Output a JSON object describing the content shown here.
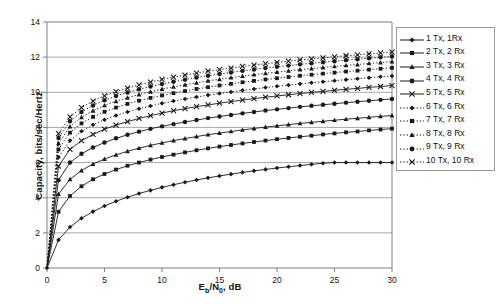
{
  "chart_data": {
    "type": "line",
    "title": "",
    "xlabel": "Eb/N0, dB",
    "xlabel_parts": {
      "pre": "E",
      "sub1": "b",
      "mid": "/N",
      "sub2": "0",
      "post": ", dB"
    },
    "ylabel": "Capacity, bits/sec/Hertz",
    "xlim": [
      0,
      30
    ],
    "ylim": [
      0,
      14
    ],
    "xticks": [
      0,
      5,
      10,
      15,
      20,
      25,
      30
    ],
    "yticks": [
      0,
      2,
      4,
      6,
      8,
      10,
      12,
      14
    ],
    "grid": "horizontal",
    "legend_position": "right-outside",
    "x": [
      0,
      1,
      2,
      3,
      4,
      5,
      6,
      7,
      8,
      9,
      10,
      11,
      12,
      13,
      14,
      15,
      16,
      17,
      18,
      19,
      20,
      21,
      22,
      23,
      24,
      25,
      26,
      27,
      28,
      29,
      30
    ],
    "series": [
      {
        "name": "1 Tx, 1Rx",
        "marker": "diamond",
        "line_style": "solid",
        "values": [
          0,
          1.6,
          2.33,
          2.83,
          3.21,
          3.53,
          3.8,
          4.03,
          4.24,
          4.42,
          4.59,
          4.74,
          4.88,
          5.01,
          5.13,
          5.24,
          5.34,
          5.44,
          5.53,
          5.61,
          5.69,
          5.76,
          5.83,
          5.9,
          5.96,
          6.0,
          6.0,
          6.0,
          6.0,
          6.0,
          6.0
        ]
      },
      {
        "name": "2 Tx, 2 Rx",
        "marker": "square",
        "line_style": "solid",
        "values": [
          0,
          3.2,
          4.1,
          4.65,
          5.05,
          5.35,
          5.6,
          5.82,
          6.0,
          6.17,
          6.32,
          6.45,
          6.58,
          6.7,
          6.81,
          6.91,
          7.0,
          7.09,
          7.17,
          7.25,
          7.33,
          7.4,
          7.47,
          7.53,
          7.6,
          7.66,
          7.72,
          7.77,
          7.83,
          7.88,
          7.93
        ]
      },
      {
        "name": "3 Tx, 3 Rx",
        "marker": "triangle",
        "line_style": "solid",
        "values": [
          0,
          4.2,
          5.05,
          5.55,
          5.92,
          6.2,
          6.44,
          6.64,
          6.82,
          6.98,
          7.12,
          7.25,
          7.37,
          7.48,
          7.59,
          7.68,
          7.77,
          7.86,
          7.94,
          8.02,
          8.09,
          8.16,
          8.23,
          8.29,
          8.35,
          8.41,
          8.47,
          8.52,
          8.58,
          8.63,
          8.68
        ]
      },
      {
        "name": "4 Tx, 4 Rx",
        "marker": "circle",
        "line_style": "solid",
        "values": [
          0,
          5.0,
          6.0,
          6.5,
          6.86,
          7.14,
          7.38,
          7.58,
          7.76,
          7.92,
          8.06,
          8.19,
          8.31,
          8.42,
          8.53,
          8.62,
          8.71,
          8.8,
          8.88,
          8.96,
          9.03,
          9.1,
          9.17,
          9.23,
          9.29,
          9.35,
          9.41,
          9.46,
          9.52,
          9.57,
          9.62
        ]
      },
      {
        "name": "5 Tx, 5 Rx",
        "marker": "cross",
        "line_style": "solid",
        "values": [
          0,
          5.8,
          6.75,
          7.25,
          7.6,
          7.9,
          8.13,
          8.33,
          8.51,
          8.67,
          8.82,
          8.95,
          9.07,
          9.18,
          9.28,
          9.38,
          9.47,
          9.56,
          9.64,
          9.72,
          9.79,
          9.86,
          9.93,
          9.99,
          10.05,
          10.11,
          10.17,
          10.22,
          10.28,
          10.33,
          10.38
        ]
      },
      {
        "name": "6 Tx, 6 Rx",
        "marker": "diamond",
        "line_style": "dotted",
        "values": [
          0,
          6.3,
          7.25,
          7.78,
          8.15,
          8.44,
          8.68,
          8.88,
          9.06,
          9.22,
          9.37,
          9.5,
          9.62,
          9.73,
          9.84,
          9.93,
          10.02,
          10.11,
          10.19,
          10.27,
          10.34,
          10.41,
          10.48,
          10.54,
          10.6,
          10.66,
          10.72,
          10.77,
          10.83,
          10.88,
          10.93
        ]
      },
      {
        "name": "7 Tx, 7 Rx",
        "marker": "square",
        "line_style": "dotted",
        "values": [
          0,
          6.75,
          7.7,
          8.23,
          8.6,
          8.89,
          9.13,
          9.34,
          9.52,
          9.68,
          9.82,
          9.95,
          10.07,
          10.19,
          10.29,
          10.39,
          10.48,
          10.57,
          10.65,
          10.73,
          10.8,
          10.87,
          10.94,
          11.0,
          11.06,
          11.12,
          11.18,
          11.23,
          11.29,
          11.34,
          11.39
        ]
      },
      {
        "name": "8 Tx, 8 Rx",
        "marker": "triangle",
        "line_style": "dotted",
        "values": [
          0,
          7.1,
          8.05,
          8.58,
          8.95,
          9.25,
          9.49,
          9.69,
          9.87,
          10.03,
          10.18,
          10.31,
          10.43,
          10.54,
          10.65,
          10.74,
          10.83,
          10.92,
          11.0,
          11.08,
          11.15,
          11.22,
          11.29,
          11.35,
          11.41,
          11.47,
          11.53,
          11.58,
          11.64,
          11.69,
          11.74
        ]
      },
      {
        "name": "9 Tx, 9 Rx",
        "marker": "circle",
        "line_style": "dotted",
        "values": [
          0,
          7.4,
          8.35,
          8.88,
          9.25,
          9.55,
          9.79,
          9.99,
          10.17,
          10.33,
          10.47,
          10.6,
          10.72,
          10.84,
          10.94,
          11.04,
          11.13,
          11.22,
          11.3,
          11.38,
          11.45,
          11.52,
          11.59,
          11.65,
          11.71,
          11.77,
          11.83,
          11.88,
          11.94,
          11.99,
          12.04
        ]
      },
      {
        "name": "10 Tx, 10 Rx",
        "marker": "cross",
        "line_style": "dotted",
        "values": [
          0,
          7.65,
          8.6,
          9.13,
          9.5,
          9.8,
          10.04,
          10.24,
          10.42,
          10.58,
          10.73,
          10.86,
          10.98,
          11.09,
          11.2,
          11.29,
          11.38,
          11.47,
          11.55,
          11.63,
          11.7,
          11.77,
          11.84,
          11.9,
          11.96,
          12.02,
          12.08,
          12.13,
          12.19,
          12.24,
          12.29
        ]
      }
    ]
  },
  "legend": {
    "entries": [
      {
        "label": "1 Tx, 1Rx"
      },
      {
        "label": "2 Tx, 2 Rx"
      },
      {
        "label": "3 Tx, 3 Rx"
      },
      {
        "label": "4 Tx, 4 Rx"
      },
      {
        "label": "5 Tx, 5 Rx"
      },
      {
        "label": "6 Tx, 6 Rx"
      },
      {
        "label": "7 Tx, 7 Rx"
      },
      {
        "label": "8 Tx, 8 Rx"
      },
      {
        "label": "9 Tx, 9 Rx"
      },
      {
        "label": "10 Tx, 10 Rx"
      }
    ]
  },
  "axes": {
    "x_title_pre": "E",
    "x_title_sub1": "b",
    "x_title_mid": "/N",
    "x_title_sub2": "0",
    "x_title_post": ", dB",
    "y_title": "Capacity, bits/sec/Hertz"
  },
  "colors": {
    "line": "#1a1a1a",
    "grid": "#a8a8a8",
    "axis": "#808080",
    "legend_border": "#9a9a9a",
    "background": "#ffffff"
  }
}
